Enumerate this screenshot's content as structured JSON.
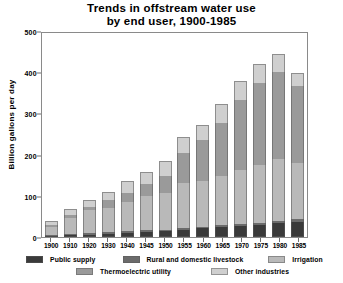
{
  "chart_data": {
    "type": "bar",
    "stacked": true,
    "title": "Trends in offstream water use by end user, 1900-1985",
    "title_line1": "Trends in offstream water use",
    "title_line2": "by end user, 1900-1985",
    "xlabel": "",
    "ylabel": "Billion gallons per day",
    "ylim": [
      0,
      500
    ],
    "yticks": [
      0,
      100,
      200,
      300,
      400,
      500
    ],
    "grid": false,
    "legend_position": "bottom",
    "categories": [
      "1900",
      "1910",
      "1920",
      "1930",
      "1940",
      "1945",
      "1950",
      "1955",
      "1960",
      "1965",
      "1970",
      "1975",
      "1980",
      "1985"
    ],
    "series": [
      {
        "name": "Public supply",
        "color": "#3a3a3a",
        "values": [
          3,
          5,
          6,
          8,
          10,
          12,
          14,
          17,
          21,
          24,
          27,
          29,
          34,
          36
        ]
      },
      {
        "name": "Rural and domestic livestock",
        "color": "#6b6b6b",
        "values": [
          2,
          2,
          3,
          3,
          4,
          4,
          4,
          4,
          4,
          4,
          5,
          5,
          6,
          7
        ]
      },
      {
        "name": "Irrigation",
        "color": "#b9b9b9",
        "values": [
          20,
          39,
          56,
          60,
          71,
          83,
          89,
          110,
          110,
          120,
          130,
          140,
          150,
          137
        ]
      },
      {
        "name": "Thermoelectric utility",
        "color": "#9a9a9a",
        "values": [
          5,
          7,
          9,
          18,
          23,
          30,
          40,
          72,
          100,
          130,
          170,
          200,
          210,
          187
        ]
      },
      {
        "name": "Other industries",
        "color": "#cfcfcf",
        "values": [
          10,
          14,
          17,
          21,
          29,
          30,
          37,
          39,
          38,
          46,
          47,
          45,
          45,
          31
        ]
      }
    ],
    "totals": [
      40,
      67,
      91,
      110,
      137,
      159,
      184,
      242,
      273,
      324,
      379,
      419,
      445,
      398
    ]
  },
  "legend": {
    "items": [
      {
        "label": "Public supply",
        "color": "#3a3a3a"
      },
      {
        "label": "Rural and domestic livestock",
        "color": "#6b6b6b"
      },
      {
        "label": "Irrigation",
        "color": "#b9b9b9"
      },
      {
        "label": "Thermoelectric utility",
        "color": "#9a9a9a"
      },
      {
        "label": "Other industries",
        "color": "#cfcfcf"
      }
    ]
  }
}
